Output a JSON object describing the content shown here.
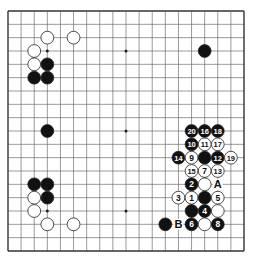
{
  "diagram": {
    "type": "go-board",
    "size": 19,
    "colors": {
      "line": "#555555",
      "black": "#111111",
      "white": "#ffffff",
      "edge": "#333333"
    },
    "star_points": [
      [
        3,
        3
      ],
      [
        9,
        3
      ],
      [
        15,
        3
      ],
      [
        3,
        9
      ],
      [
        9,
        9
      ],
      [
        15,
        9
      ],
      [
        3,
        15
      ],
      [
        9,
        15
      ],
      [
        15,
        15
      ]
    ],
    "stones": [
      {
        "c": 3,
        "r": 2,
        "color": "W"
      },
      {
        "c": 5,
        "r": 2,
        "color": "W"
      },
      {
        "c": 2,
        "r": 3,
        "color": "W"
      },
      {
        "c": 2,
        "r": 4,
        "color": "W"
      },
      {
        "c": 3,
        "r": 4,
        "color": "B"
      },
      {
        "c": 2,
        "r": 5,
        "color": "B"
      },
      {
        "c": 3,
        "r": 5,
        "color": "B"
      },
      {
        "c": 15,
        "r": 3,
        "color": "B"
      },
      {
        "c": 3,
        "r": 9,
        "color": "B"
      },
      {
        "c": 2,
        "r": 13,
        "color": "B"
      },
      {
        "c": 3,
        "r": 13,
        "color": "B"
      },
      {
        "c": 2,
        "r": 14,
        "color": "W"
      },
      {
        "c": 3,
        "r": 14,
        "color": "B"
      },
      {
        "c": 2,
        "r": 15,
        "color": "W"
      },
      {
        "c": 3,
        "r": 16,
        "color": "W"
      },
      {
        "c": 5,
        "r": 16,
        "color": "W"
      },
      {
        "c": 14,
        "r": 9,
        "color": "B",
        "label": "20"
      },
      {
        "c": 15,
        "r": 9,
        "color": "B",
        "label": "16"
      },
      {
        "c": 16,
        "r": 9,
        "color": "B",
        "label": "18"
      },
      {
        "c": 14,
        "r": 10,
        "color": "B",
        "label": "10"
      },
      {
        "c": 15,
        "r": 10,
        "color": "W",
        "label": "11"
      },
      {
        "c": 16,
        "r": 10,
        "color": "W",
        "label": "17"
      },
      {
        "c": 13,
        "r": 11,
        "color": "B",
        "label": "14"
      },
      {
        "c": 14,
        "r": 11,
        "color": "W",
        "label": "9"
      },
      {
        "c": 15,
        "r": 11,
        "color": "B"
      },
      {
        "c": 16,
        "r": 11,
        "color": "B",
        "label": "12"
      },
      {
        "c": 17,
        "r": 11,
        "color": "W",
        "label": "19"
      },
      {
        "c": 14,
        "r": 12,
        "color": "W",
        "label": "15"
      },
      {
        "c": 15,
        "r": 12,
        "color": "W",
        "label": "7"
      },
      {
        "c": 16,
        "r": 12,
        "color": "W",
        "label": "13"
      },
      {
        "c": 14,
        "r": 13,
        "color": "B",
        "label": "2"
      },
      {
        "c": 15,
        "r": 13,
        "color": "W"
      },
      {
        "c": 13,
        "r": 14,
        "color": "W",
        "label": "3"
      },
      {
        "c": 14,
        "r": 14,
        "color": "W",
        "label": "1"
      },
      {
        "c": 15,
        "r": 14,
        "color": "B"
      },
      {
        "c": 16,
        "r": 14,
        "color": "W",
        "label": "5"
      },
      {
        "c": 14,
        "r": 15,
        "color": "B"
      },
      {
        "c": 15,
        "r": 15,
        "color": "B",
        "label": "4"
      },
      {
        "c": 16,
        "r": 15,
        "color": "W"
      },
      {
        "c": 12,
        "r": 16,
        "color": "B"
      },
      {
        "c": 14,
        "r": 16,
        "color": "B",
        "label": "6"
      },
      {
        "c": 15,
        "r": 16,
        "color": "W"
      },
      {
        "c": 16,
        "r": 16,
        "color": "B",
        "label": "8"
      }
    ],
    "markers": [
      {
        "c": 16,
        "r": 13,
        "label": "A"
      },
      {
        "c": 13,
        "r": 16,
        "label": "B"
      }
    ]
  }
}
